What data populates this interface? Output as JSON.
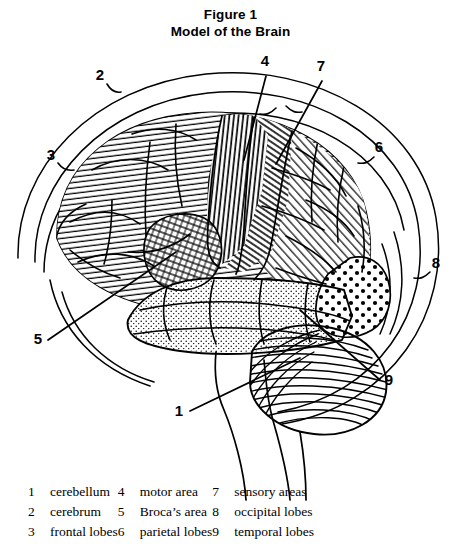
{
  "figure": {
    "title_line1": "Figure 1",
    "title_line2": "Model of the Brain",
    "ink_color": "#000000",
    "background_color": "#ffffff"
  },
  "callouts": [
    {
      "id": "c2",
      "number": "2",
      "x": 100,
      "y": 80,
      "target": "cerebrum (outer contour)"
    },
    {
      "id": "c3",
      "number": "3",
      "x": 51,
      "y": 160,
      "target": "frontal lobes (outer contour)"
    },
    {
      "id": "c4",
      "number": "4",
      "x": 265,
      "y": 66,
      "target": "motor area"
    },
    {
      "id": "c7",
      "number": "7",
      "x": 321,
      "y": 71,
      "target": "sensory areas"
    },
    {
      "id": "c6",
      "number": "6",
      "x": 379,
      "y": 152,
      "target": "parietal lobes (outer contour)"
    },
    {
      "id": "c8",
      "number": "8",
      "x": 436,
      "y": 268,
      "target": "occipital lobes (outer contour)"
    },
    {
      "id": "c5",
      "number": "5",
      "x": 38,
      "y": 344,
      "target": "Broca's area"
    },
    {
      "id": "c9",
      "number": "9",
      "x": 389,
      "y": 385,
      "target": "temporal lobes"
    },
    {
      "id": "c1",
      "number": "1",
      "x": 179,
      "y": 416,
      "target": "cerebellum"
    }
  ],
  "legend": {
    "columns": [
      [
        {
          "number": "1",
          "label": "cerebellum"
        },
        {
          "number": "2",
          "label": "cerebrum"
        },
        {
          "number": "3",
          "label": "frontal lobes"
        }
      ],
      [
        {
          "number": "4",
          "label": "motor area"
        },
        {
          "number": "5",
          "label": "Broca’s area"
        },
        {
          "number": "6",
          "label": "parietal lobes"
        }
      ],
      [
        {
          "number": "7",
          "label": "sensory areas"
        },
        {
          "number": "8",
          "label": "occipital lobes"
        },
        {
          "number": "9",
          "label": "temporal lobes"
        }
      ]
    ]
  },
  "regions": [
    {
      "name": "frontal-lobe",
      "texture": "horizontal-hatch",
      "callout": "3"
    },
    {
      "name": "motor-area",
      "texture": "dense-vertical-hatch",
      "callout": "4"
    },
    {
      "name": "sensory-area",
      "texture": "diagonal-hatch",
      "callout": "7"
    },
    {
      "name": "parietal-lobe",
      "texture": "light-diagonal-hatch",
      "callout": "6"
    },
    {
      "name": "occipital-lobe",
      "texture": "bold-dots",
      "callout": "8"
    },
    {
      "name": "temporal-lobe",
      "texture": "fine-stipple",
      "callout": "9"
    },
    {
      "name": "cerebellum",
      "texture": "concentric-lines",
      "callout": "1"
    },
    {
      "name": "brocas-area",
      "texture": "cross-hatch",
      "callout": "5"
    },
    {
      "name": "brainstem",
      "texture": "plain",
      "callout": ""
    }
  ]
}
